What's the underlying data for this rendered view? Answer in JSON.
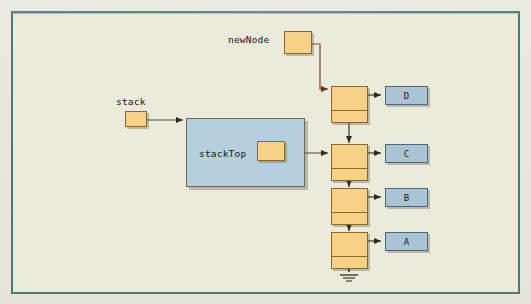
{
  "figure": {
    "type": "linked-list-stack-diagram",
    "frame_border_color": "#3f7f79",
    "background_color": "#eceada",
    "node_fill_color": "#f6d187",
    "node_border_color": "#8a6a26",
    "data_fill_color": "#a9c5d5",
    "data_border_color": "#4a6a7c",
    "panel_fill_color": "#b6cfdd"
  },
  "labels": {
    "newNode": "newNode",
    "stack": "stack",
    "stackTop": "stackTop"
  },
  "nodes": [
    {
      "id": "node-d",
      "data": "D"
    },
    {
      "id": "node-c",
      "data": "C"
    },
    {
      "id": "node-b",
      "data": "B"
    },
    {
      "id": "node-a",
      "data": "A"
    }
  ],
  "terminator": {
    "name": "null-ground-symbol"
  }
}
